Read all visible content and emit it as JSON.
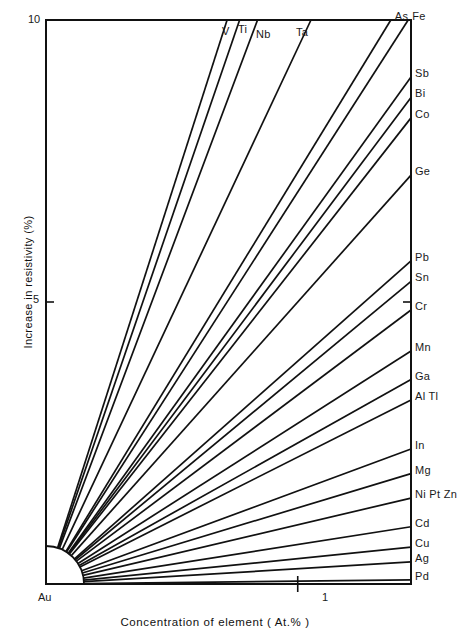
{
  "chart_data": {
    "type": "line",
    "title": "",
    "xlabel": "Concentration of element ( At.% )",
    "ylabel": "Increase in resistivity (%)",
    "xlim": [
      0,
      1.45
    ],
    "ylim": [
      0,
      10
    ],
    "x_origin_label": "Au",
    "xticks": [
      {
        "value": 1,
        "label": "1"
      }
    ],
    "yticks": [
      {
        "value": 10,
        "label": "10"
      },
      {
        "value": 5,
        "label": "5"
      }
    ],
    "grid": false,
    "legend": "none",
    "note": "Fan of straight lines radiating from origin; each line is the resistivity increase per at.% of the named solute in gold. Value = slope (% per at.%) read at the plot edge.",
    "series": [
      {
        "name": "V",
        "label": "V",
        "slope": 13.9,
        "exit": "top"
      },
      {
        "name": "Ti",
        "label": "Ti",
        "slope": 13.0,
        "exit": "top"
      },
      {
        "name": "Nb",
        "label": "Nb",
        "slope": 11.9,
        "exit": "top"
      },
      {
        "name": "Ta",
        "label": "Ta",
        "slope": 9.5,
        "exit": "top"
      },
      {
        "name": "As",
        "label": "As",
        "slope": 7.3,
        "exit": "right"
      },
      {
        "name": "Fe",
        "label": "Fe",
        "slope": 6.95,
        "exit": "right"
      },
      {
        "name": "Sb",
        "label": "Sb",
        "slope": 6.2,
        "exit": "right"
      },
      {
        "name": "Bi",
        "label": "Bi",
        "slope": 5.95,
        "exit": "right"
      },
      {
        "name": "Co",
        "label": "Co",
        "slope": 5.7,
        "exit": "right"
      },
      {
        "name": "Ge",
        "label": "Ge",
        "slope": 5.0,
        "exit": "right"
      },
      {
        "name": "Pb",
        "label": "Pb",
        "slope": 3.95,
        "exit": "right"
      },
      {
        "name": "Sn",
        "label": "Sn",
        "slope": 3.7,
        "exit": "right"
      },
      {
        "name": "Cr",
        "label": "Cr",
        "slope": 3.35,
        "exit": "right"
      },
      {
        "name": "Mn",
        "label": "Mn",
        "slope": 2.85,
        "exit": "right"
      },
      {
        "name": "Ga",
        "label": "Ga",
        "slope": 2.5,
        "exit": "right"
      },
      {
        "name": "Al Tl",
        "label": "Al Tl",
        "slope": 2.25,
        "exit": "right"
      },
      {
        "name": "In",
        "label": "In",
        "slope": 1.65,
        "exit": "right"
      },
      {
        "name": "Mg",
        "label": "Mg",
        "slope": 1.35,
        "exit": "right"
      },
      {
        "name": "Ni Pt Zn",
        "label": "Ni Pt Zn",
        "slope": 1.05,
        "exit": "right"
      },
      {
        "name": "Cd",
        "label": "Cd",
        "slope": 0.7,
        "exit": "right"
      },
      {
        "name": "Cu",
        "label": "Cu",
        "slope": 0.45,
        "exit": "right"
      },
      {
        "name": "Ag",
        "label": "Ag",
        "slope": 0.27,
        "exit": "right"
      },
      {
        "name": "Pd",
        "label": "Pd",
        "slope": 0.05,
        "exit": "right"
      }
    ]
  }
}
